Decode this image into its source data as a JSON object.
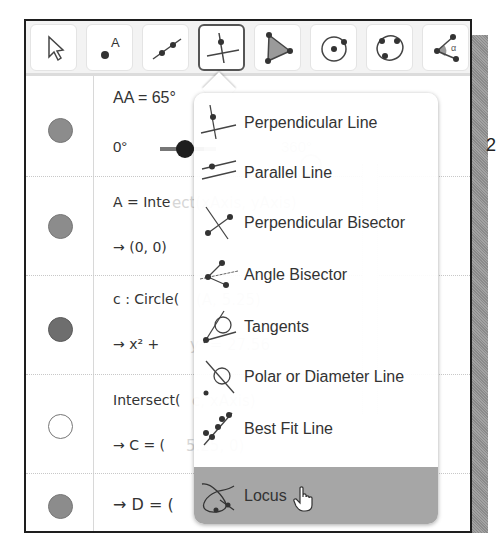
{
  "toolbar": {
    "tools": [
      {
        "name": "Move",
        "icon": "arrow-cursor-icon",
        "active": false
      },
      {
        "name": "Point",
        "icon": "point-icon",
        "label": "A",
        "active": false
      },
      {
        "name": "Line",
        "icon": "line-icon",
        "active": false
      },
      {
        "name": "Perpendicular Line",
        "icon": "perpendicular-line-icon",
        "active": true
      },
      {
        "name": "Polygon",
        "icon": "polygon-icon",
        "active": false
      },
      {
        "name": "Circle with Center",
        "icon": "circle-center-icon",
        "active": false
      },
      {
        "name": "Circle through 3 Points",
        "icon": "circle-three-points-icon",
        "active": false
      },
      {
        "name": "Angle",
        "icon": "angle-icon",
        "label": "α",
        "active": false
      }
    ]
  },
  "algebra": {
    "rows": [
      {
        "line1": "AA = 65°",
        "slider_min": "0°",
        "slider_max": "360°",
        "marker": "filled"
      },
      {
        "line1": "A = Intersect(xAxis, yAxis)",
        "line1_visible": "A = Inte",
        "line2": "→ (0, 0)",
        "marker": "filled"
      },
      {
        "line1": "c : Circle(A, 5.25)",
        "line1_visible": "c : Circle(",
        "line2": "→ x² + y² = 27.56",
        "line2_visible": "→ x² +",
        "marker": "dark"
      },
      {
        "line1": "Intersect(c, xAxis)",
        "line1_visible": "Intersect(",
        "line2": "→ C = (5.25, 0)",
        "line2_visible": "→ C = (",
        "marker": "hollow"
      },
      {
        "line2": "→ D = (",
        "marker": "filled"
      }
    ],
    "faded": {
      "row1_right": "360°",
      "row2": "ect(xAxis, yAxis)",
      "row3": "(A, 5.25)",
      "row3b": "y² = 27.56",
      "row4": "c, xAxis)",
      "row4b": "5.25, 0)"
    }
  },
  "menu": {
    "items": [
      {
        "label": "Perpendicular Line",
        "icon": "perpendicular-line-icon"
      },
      {
        "label": "Parallel Line",
        "icon": "parallel-line-icon"
      },
      {
        "label": "Perpendicular Bisector",
        "icon": "perpendicular-bisector-icon"
      },
      {
        "label": "Angle Bisector",
        "icon": "angle-bisector-icon"
      },
      {
        "label": "Tangents",
        "icon": "tangents-icon"
      },
      {
        "label": "Polar or Diameter Line",
        "icon": "polar-line-icon"
      },
      {
        "label": "Best Fit Line",
        "icon": "best-fit-line-icon"
      },
      {
        "label": "Locus",
        "icon": "locus-icon",
        "hovered": true
      }
    ]
  },
  "right_fragment": "2",
  "colors": {
    "hover_bg": "#a6a6a6",
    "marker_fill": "#8c8c8c",
    "active_border": "#555555"
  }
}
